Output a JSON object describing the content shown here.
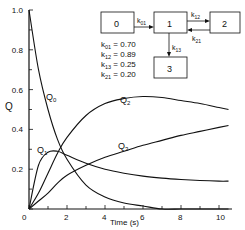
{
  "chart_data": {
    "type": "line",
    "title": "",
    "xlabel": "Time (s)",
    "ylabel": "Q",
    "xlim": [
      0,
      10.5
    ],
    "ylim": [
      0,
      1.0
    ],
    "xticks": [
      "0",
      "2",
      "4",
      "6",
      "8",
      "10"
    ],
    "yticks": [
      "0",
      "0.2",
      "0.4",
      "0.6",
      "0.8",
      "1.0"
    ],
    "grid": false,
    "x": [
      0,
      0.5,
      1,
      1.5,
      2,
      3,
      4,
      5,
      6,
      7,
      8,
      9,
      10,
      10.5
    ],
    "series": [
      {
        "name": "Q0",
        "values": [
          1.0,
          0.7,
          0.5,
          0.35,
          0.25,
          0.12,
          0.06,
          0.03,
          0.015,
          0.0,
          0.0,
          0.0,
          0.0,
          0.0
        ]
      },
      {
        "name": "Q1",
        "values": [
          0.0,
          0.22,
          0.285,
          0.29,
          0.27,
          0.23,
          0.2,
          0.18,
          0.165,
          0.155,
          0.148,
          0.143,
          0.14,
          0.14
        ]
      },
      {
        "name": "Q2",
        "values": [
          0.0,
          0.08,
          0.18,
          0.28,
          0.36,
          0.47,
          0.53,
          0.555,
          0.565,
          0.56,
          0.545,
          0.53,
          0.51,
          0.5
        ]
      },
      {
        "name": "Q3",
        "values": [
          0.0,
          0.04,
          0.08,
          0.13,
          0.17,
          0.22,
          0.26,
          0.29,
          0.32,
          0.345,
          0.37,
          0.39,
          0.41,
          0.42
        ]
      }
    ],
    "annotations": [
      "Q0",
      "Q1",
      "Q2",
      "Q3"
    ],
    "legend": {
      "position": "none"
    }
  },
  "diagram": {
    "boxes": [
      "0",
      "1",
      "2",
      "3"
    ],
    "arrows": [
      "k01",
      "k12",
      "k21",
      "k13"
    ]
  },
  "rates": [
    {
      "sym": "k",
      "sub": "01",
      "value": "= 0.70"
    },
    {
      "sym": "k",
      "sub": "12",
      "value": "= 0.89"
    },
    {
      "sym": "k",
      "sub": "13",
      "value": "= 0.25"
    },
    {
      "sym": "k",
      "sub": "21",
      "value": "= 0.20"
    }
  ]
}
